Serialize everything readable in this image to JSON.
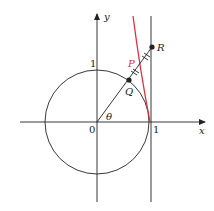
{
  "diagram": {
    "labels": {
      "x_axis": "x",
      "y_axis": "y",
      "origin": "0",
      "x_one": "1",
      "y_one": "1",
      "theta": "θ",
      "point_p": "P",
      "point_q": "Q",
      "point_r": "R"
    },
    "colors": {
      "ink": "#222222",
      "curve": "#d9333f"
    },
    "angle_deg": 55
  }
}
